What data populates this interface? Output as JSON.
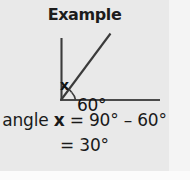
{
  "card": {
    "background_color": "#e9e9e9",
    "edge_color": "#f5f5f5"
  },
  "title": {
    "text": "Example"
  },
  "figure": {
    "name": "angle-diagram",
    "stroke_color": "#3a3a3a",
    "labels": {
      "unknown_angle": "x",
      "known_angle": "60°"
    },
    "rays": {
      "vertical_ray": "vertical ray from vertex upward",
      "horizontal_ray": "horizontal ray from vertex to the right",
      "diagonal_ray": "diagonal ray from vertex at 60 degrees"
    },
    "arcs": {
      "unknown_angle_arc": "arc between vertical ray and diagonal ray",
      "known_angle_arc": "arc between diagonal ray and horizontal ray"
    }
  },
  "equations": {
    "line1": {
      "prefix": "angle ",
      "variable": "x",
      "suffix": " = 90° – 60°"
    },
    "line2": {
      "text": "= 30°"
    }
  }
}
